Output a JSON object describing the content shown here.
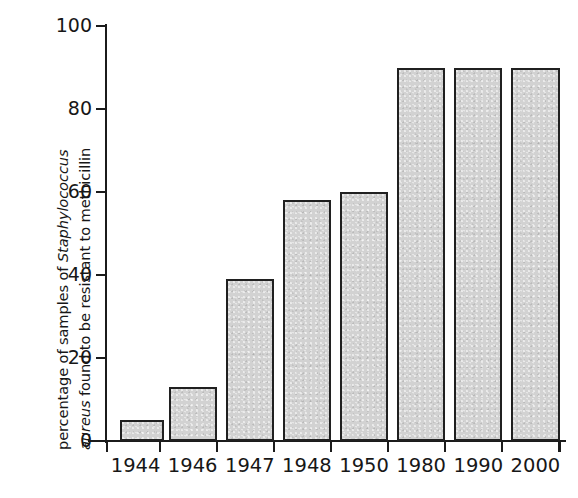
{
  "chart_data": {
    "type": "bar",
    "title": "",
    "subtitle": "",
    "xlabel": "",
    "ylabel_line1_prefix": "percentage of samples of ",
    "ylabel_line1_italic": "Staphylococcus",
    "ylabel_line2_italic": "aureus",
    "ylabel_line2_suffix": " found to be resistant to methicillin",
    "ylabel_full": "percentage of samples of Staphylococcus aureus found to be resistant to methicillin",
    "categories": [
      "1944",
      "1946",
      "1947",
      "1948",
      "1950",
      "1980",
      "1990",
      "2000"
    ],
    "values": [
      5,
      13,
      39,
      58,
      60,
      90,
      90,
      90
    ],
    "ylim": [
      0,
      100
    ],
    "yticks": [
      0,
      20,
      40,
      60,
      80,
      100
    ],
    "ytick_labels": [
      "0",
      "20",
      "40",
      "60",
      "80",
      "100"
    ],
    "grid": false,
    "legend": false,
    "legend_position": "none",
    "bar_fill_color": "#d2d2d2",
    "bar_edge_color": "#202020",
    "axis_color": "#1b1b1b",
    "background_color": "#ffffff"
  }
}
